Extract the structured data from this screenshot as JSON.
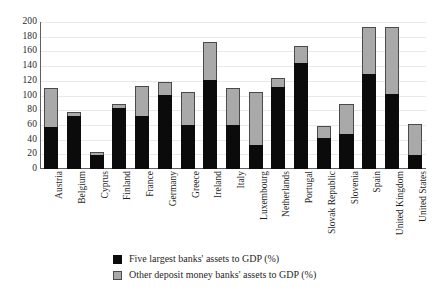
{
  "chart_data": {
    "type": "bar",
    "subtype": "stacked-vertical",
    "title": "",
    "subtitle": "",
    "xlabel": "",
    "ylabel": "",
    "ylim": [
      0,
      200
    ],
    "ytick_step": 20,
    "yticks": [
      200,
      180,
      160,
      140,
      120,
      100,
      80,
      60,
      40,
      20,
      0
    ],
    "grid": true,
    "grid_axis": "y",
    "legend_position": "bottom-center",
    "categories": [
      "Austria",
      "Belgium",
      "Cyprus",
      "Finland",
      "France",
      "Germany",
      "Greece",
      "Ireland",
      "Italy",
      "Luxembourg",
      "Netherlands",
      "Portugal",
      "Slovak Republic",
      "Slovenia",
      "Spain",
      "United Kingdom",
      "United States"
    ],
    "series": [
      {
        "name": "Five largest banks' assets to GDP (%)",
        "color": "#0b0b0b",
        "values": [
          57,
          72,
          19,
          83,
          72,
          101,
          60,
          121,
          60,
          33,
          112,
          144,
          42,
          48,
          129,
          102,
          19
        ]
      },
      {
        "name": "Other deposit money banks' assets to GDP (%)",
        "color": "#a9a9a9",
        "values": [
          53,
          6,
          4,
          5,
          41,
          17,
          45,
          52,
          50,
          72,
          12,
          23,
          16,
          40,
          64,
          91,
          42
        ]
      }
    ],
    "totals": [
      110,
      78,
      23,
      88,
      113,
      118,
      105,
      173,
      110,
      105,
      124,
      167,
      58,
      88,
      193,
      193,
      61
    ]
  },
  "legend": {
    "items": [
      {
        "label": "Five largest banks' assets to GDP (%)",
        "swatch": "five"
      },
      {
        "label": "Other deposit money banks' assets to GDP (%)",
        "swatch": "other"
      }
    ]
  }
}
